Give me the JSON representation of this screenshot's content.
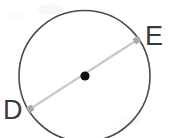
{
  "figure": {
    "type": "circle-with-diameter",
    "background_color": "#ffffff",
    "width": 177,
    "height": 138,
    "circle": {
      "center_x": 84.5,
      "center_y": 76,
      "radius": 65.5,
      "stroke_color": "#4a4a4a",
      "stroke_width": 1.6,
      "fill": "none"
    },
    "center_point": {
      "label": "",
      "x": 85,
      "y": 76,
      "radius": 4.6,
      "color": "#111111"
    },
    "chord": {
      "name": "diameter-DE",
      "x1": 30,
      "y1": 109,
      "x2": 137,
      "y2": 40,
      "stroke_color": "#c9c9c9",
      "stroke_width": 2.2
    },
    "endpoints": [
      {
        "id": "D",
        "label": "D",
        "x": 30,
        "y": 109,
        "marker_size": 6.5,
        "marker_color": "#a8a8a8"
      },
      {
        "id": "E",
        "label": "E",
        "x": 137,
        "y": 40,
        "marker_size": 6.5,
        "marker_color": "#a8a8a8"
      }
    ],
    "labels": {
      "D": "D",
      "E": "E",
      "color": "#3b3b3b",
      "font_size": 27
    }
  }
}
